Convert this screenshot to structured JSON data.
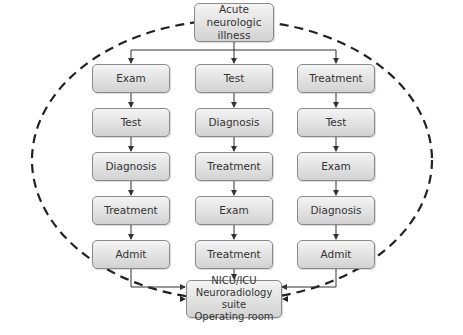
{
  "diagram": {
    "top_node": {
      "lines": [
        "Acute neurologic",
        "illness"
      ]
    },
    "columns": [
      {
        "steps": [
          "Exam",
          "Test",
          "Diagnosis",
          "Treatment",
          "Admit"
        ]
      },
      {
        "steps": [
          "Test",
          "Diagnosis",
          "Treatment",
          "Exam",
          "Treatment"
        ]
      },
      {
        "steps": [
          "Treatment",
          "Test",
          "Exam",
          "Diagnosis",
          "Admit"
        ]
      }
    ],
    "bottom_node": {
      "lines": [
        "NICU/ICU",
        "Neuroradiology suite",
        "Operating room"
      ]
    },
    "colors": {
      "box_border": "#8a8a8a",
      "box_fill_top": "#f4f4f4",
      "box_fill_bottom": "#d2d2d2",
      "line": "#333333",
      "dashed_ellipse": "#222222",
      "text": "#333333"
    }
  }
}
